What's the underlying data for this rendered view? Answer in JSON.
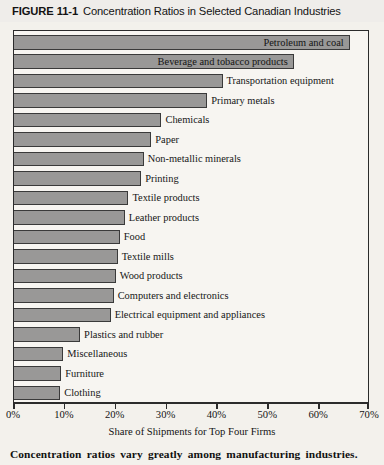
{
  "header": {
    "figure_number": "FIGURE 11-1",
    "title": "Concentration Ratios in Selected Canadian Industries"
  },
  "caption": "Concentration ratios vary greatly among manufacturing industries.",
  "colors": {
    "bar_fill": "#999897",
    "bar_border": "#3a3a3a",
    "frame": "#2b2b2b",
    "page_background": "#f3f1ec",
    "plot_background": "#f7f5f1"
  },
  "chart_data": {
    "type": "bar",
    "orientation": "horizontal",
    "title": "Concentration Ratios in Selected Canadian Industries",
    "xlabel": "Share of Shipments for Top Four Firms",
    "ylabel": "",
    "xlim": [
      0,
      70
    ],
    "grid": false,
    "legend": null,
    "xticks": [
      0,
      10,
      20,
      30,
      40,
      50,
      60,
      70
    ],
    "xticklabels": [
      "0%",
      "10%",
      "20%",
      "30%",
      "40%",
      "50%",
      "60%",
      "70%"
    ],
    "categories": [
      "Petroleum and coal",
      "Beverage and tobacco products",
      "Transportation equipment",
      "Primary metals",
      "Chemicals",
      "Paper",
      "Non-metallic minerals",
      "Printing",
      "Textile products",
      "Leather products",
      "Food",
      "Textile mills",
      "Wood products",
      "Computers and electronics",
      "Electrical equipment and appliances",
      "Plastics and rubber",
      "Miscellaneous",
      "Furniture",
      "Clothing",
      "Machinery",
      "Fabricated metals"
    ],
    "values": [
      66,
      55,
      41,
      38,
      29,
      27,
      25.5,
      25,
      22.5,
      21.8,
      20.8,
      20.4,
      20,
      19.6,
      19,
      13,
      9.7,
      9.3,
      9.1,
      6.7,
      8
    ],
    "label_placement": [
      "inside",
      "inside",
      "outside",
      "outside",
      "outside",
      "outside",
      "outside",
      "outside",
      "outside",
      "outside",
      "outside",
      "outside",
      "outside",
      "outside",
      "outside",
      "outside",
      "outside",
      "outside",
      "outside",
      "outside",
      "outside"
    ]
  }
}
